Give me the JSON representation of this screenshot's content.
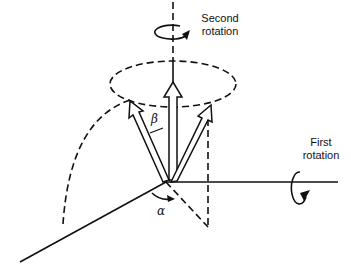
{
  "diagram": {
    "type": "rotation-diagram",
    "labels": {
      "second_rotation_line1": "Second",
      "second_rotation_line2": "rotation",
      "first_rotation_line1": "First",
      "first_rotation_line2": "rotation",
      "beta": "β",
      "alpha": "α"
    },
    "colors": {
      "stroke": "#111111",
      "background": "#ffffff"
    }
  }
}
